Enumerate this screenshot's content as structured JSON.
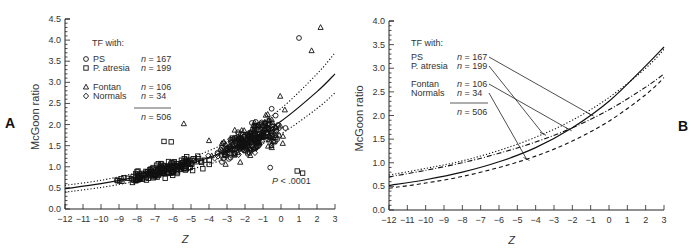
{
  "chart_data": [
    {
      "panel": "A",
      "type": "scatter",
      "xlabel": "Z",
      "ylabel": "McGoon ratio",
      "xlim": [
        -12,
        3
      ],
      "ylim": [
        0.0,
        4.5
      ],
      "xticks": [
        -12,
        -11,
        -10,
        -9,
        -8,
        -7,
        -6,
        -5,
        -4,
        -3,
        -2,
        -1,
        0,
        1,
        2,
        3
      ],
      "yticks": [
        0.0,
        0.5,
        1.0,
        1.5,
        2.0,
        2.5,
        3.0,
        3.5,
        4.0,
        4.5
      ],
      "grid": false,
      "legend_title": "TF with:",
      "legend": [
        {
          "marker": "circle",
          "label": "PS",
          "n": "n = 167"
        },
        {
          "marker": "square",
          "label": "P. atresia",
          "n": "n = 199"
        },
        {
          "marker": "triangle",
          "label": "Fontan",
          "n": "n = 106"
        },
        {
          "marker": "diamond",
          "label": "Normals",
          "n": "n =  34"
        }
      ],
      "total": "n = 506",
      "annotation": "P < .0001",
      "fit": {
        "style": "solid",
        "x": [
          -12,
          -10,
          -8,
          -6,
          -4,
          -2,
          0,
          2,
          3
        ],
        "y": [
          0.48,
          0.6,
          0.76,
          0.96,
          1.22,
          1.58,
          2.08,
          2.78,
          3.2
        ]
      },
      "ci_upper": {
        "style": "dotted",
        "x": [
          -12,
          -10,
          -8,
          -6,
          -4,
          -2,
          0,
          2,
          3
        ],
        "y": [
          0.56,
          0.68,
          0.86,
          1.08,
          1.38,
          1.8,
          2.38,
          3.2,
          3.7
        ]
      },
      "ci_lower": {
        "style": "dotted",
        "x": [
          -12,
          -10,
          -8,
          -6,
          -4,
          -2,
          0,
          2,
          3
        ],
        "y": [
          0.4,
          0.51,
          0.66,
          0.84,
          1.06,
          1.36,
          1.78,
          2.38,
          2.75
        ]
      },
      "points_summary": "506 points; squares (P. atresia) concentrated at Z -12 to -5 with ratios 0.4–1.6; circles (PS) concentrated Z -5 to 2 with ratios 1.0–3.5; triangles (Fontan) scattered up to 4.3 at Z≈2.5"
    },
    {
      "panel": "B",
      "type": "line",
      "xlabel": "Z",
      "ylabel": "McGoon ratio",
      "xlim": [
        -12,
        3
      ],
      "ylim": [
        0.0,
        4.0
      ],
      "xticks": [
        -12,
        -11,
        -10,
        -9,
        -8,
        -7,
        -6,
        -5,
        -4,
        -3,
        -2,
        -1,
        0,
        1,
        2,
        3
      ],
      "yticks": [
        0.0,
        0.5,
        1.0,
        1.5,
        2.0,
        2.5,
        3.0,
        3.5,
        4.0
      ],
      "grid": false,
      "legend_title": "TF with:",
      "series": [
        {
          "name": "PS",
          "n": "n = 167",
          "style": "solid",
          "x": [
            -12,
            -10,
            -8,
            -6,
            -4,
            -2,
            0,
            2,
            3
          ],
          "y": [
            0.52,
            0.64,
            0.8,
            1.02,
            1.32,
            1.74,
            2.3,
            3.05,
            3.45
          ]
        },
        {
          "name": "P. atresia",
          "n": "n = 199",
          "style": "dotted",
          "x": [
            -12,
            -10,
            -8,
            -6,
            -4,
            -2,
            0,
            2,
            3
          ],
          "y": [
            0.74,
            0.88,
            1.04,
            1.26,
            1.54,
            1.9,
            2.38,
            3.0,
            3.4
          ]
        },
        {
          "name": "Fontan",
          "n": "n = 106",
          "style": "dash-dot",
          "x": [
            -12,
            -10,
            -8,
            -6,
            -4,
            -2,
            0,
            2,
            3
          ],
          "y": [
            0.7,
            0.84,
            1.0,
            1.2,
            1.44,
            1.74,
            2.12,
            2.6,
            2.88
          ]
        },
        {
          "name": "Normals",
          "n": "n =  34",
          "style": "dashed",
          "x": [
            -12,
            -10,
            -8,
            -6,
            -4,
            -2,
            0,
            2,
            3
          ],
          "y": [
            0.46,
            0.57,
            0.71,
            0.9,
            1.14,
            1.46,
            1.88,
            2.44,
            2.8
          ]
        }
      ],
      "total": "n = 506"
    }
  ],
  "labels": {
    "panel_a": "A",
    "panel_b": "B",
    "ylabel": "McGoon ratio",
    "xlabel": "Z",
    "legend_title": "TF with:",
    "ps": "PS",
    "patresia": "P. atresia",
    "fontan": "Fontan",
    "normals": "Normals",
    "n_ps": "= 167",
    "n_pa": "= 199",
    "n_fo": "= 106",
    "n_no": "=  34",
    "n_total": "= 506",
    "n_sym": "n",
    "p_sym": "P",
    "p_value": " < .0001"
  }
}
